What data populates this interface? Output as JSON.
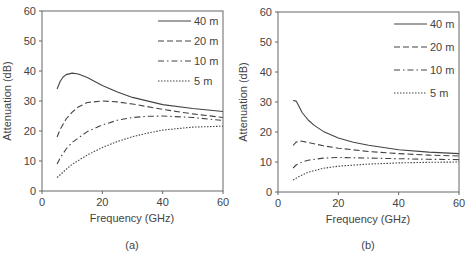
{
  "chart_data": [
    {
      "type": "line",
      "panel": "a",
      "caption": "(a)",
      "title": "",
      "xlabel": "Frequency (GHz)",
      "ylabel": "Attenuation (dB)",
      "xlim": [
        0,
        60
      ],
      "ylim": [
        0,
        60
      ],
      "xticks": [
        0,
        20,
        40,
        60
      ],
      "yticks": [
        0,
        10,
        20,
        30,
        40,
        50,
        60
      ],
      "grid": false,
      "legend_position": "upper right",
      "series": [
        {
          "name": "40 m",
          "style": "solid",
          "x": [
            5,
            6,
            7,
            8,
            10,
            12,
            15,
            20,
            25,
            30,
            40,
            50,
            60
          ],
          "y": [
            34,
            36.5,
            38,
            38.8,
            39.3,
            39,
            37.8,
            35.2,
            33,
            31.2,
            28.8,
            27.5,
            26.5
          ]
        },
        {
          "name": "20 m",
          "style": "dashed",
          "x": [
            5,
            6,
            8,
            10,
            12,
            15,
            20,
            25,
            30,
            40,
            50,
            60
          ],
          "y": [
            18,
            20.5,
            24,
            26.3,
            28,
            29.5,
            30,
            29.7,
            29,
            27.2,
            25.7,
            24.5
          ]
        },
        {
          "name": "10 m",
          "style": "dashdot",
          "x": [
            5,
            6,
            8,
            10,
            15,
            20,
            25,
            30,
            35,
            40,
            50,
            60
          ],
          "y": [
            9,
            11,
            14,
            16.2,
            19.8,
            22,
            23.6,
            24.5,
            24.9,
            25,
            24.5,
            23.5
          ]
        },
        {
          "name": "5 m",
          "style": "dotted",
          "x": [
            5,
            8,
            10,
            15,
            20,
            25,
            30,
            35,
            40,
            50,
            60
          ],
          "y": [
            4.5,
            7.2,
            8.9,
            12,
            14.5,
            16.5,
            18.1,
            19.3,
            20.3,
            21.3,
            21.6
          ]
        }
      ]
    },
    {
      "type": "line",
      "panel": "b",
      "caption": "(b)",
      "title": "",
      "xlabel": "Frequency (GHz)",
      "ylabel": "Attenuation (dB)",
      "xlim": [
        0,
        60
      ],
      "ylim": [
        0,
        60
      ],
      "xticks": [
        0,
        20,
        40,
        60
      ],
      "yticks": [
        0,
        10,
        20,
        30,
        40,
        50,
        60
      ],
      "grid": false,
      "legend_position": "upper right",
      "series": [
        {
          "name": "40 m",
          "style": "solid",
          "x": [
            5,
            6,
            7,
            8,
            10,
            12,
            15,
            20,
            25,
            30,
            40,
            50,
            60
          ],
          "y": [
            30.5,
            30.3,
            28.5,
            26.5,
            24,
            22.2,
            20.2,
            18,
            16.6,
            15.6,
            14.1,
            13.3,
            12.8
          ]
        },
        {
          "name": "20 m",
          "style": "dashed",
          "x": [
            5,
            6,
            7,
            8,
            10,
            15,
            20,
            30,
            40,
            50,
            60
          ],
          "y": [
            15.5,
            16.6,
            17,
            16.9,
            16.5,
            15.4,
            14.6,
            13.5,
            12.8,
            12.3,
            12
          ]
        },
        {
          "name": "10 m",
          "style": "dashdot",
          "x": [
            5,
            6,
            8,
            10,
            15,
            20,
            30,
            40,
            50,
            60
          ],
          "y": [
            8,
            9,
            10,
            10.6,
            11.3,
            11.5,
            11.3,
            11.1,
            10.9,
            10.8
          ]
        },
        {
          "name": "5 m",
          "style": "dotted",
          "x": [
            5,
            7,
            10,
            15,
            20,
            30,
            40,
            50,
            60
          ],
          "y": [
            4,
            5.2,
            6.6,
            7.9,
            8.6,
            9.3,
            9.7,
            9.9,
            10
          ]
        }
      ]
    }
  ],
  "panels": {
    "a": {
      "caption": "(a)",
      "xlabel": "Frequency (GHz)",
      "ylabel": "Attenuation (dB)",
      "xtick_labels": [
        "0",
        "20",
        "40",
        "60"
      ],
      "ytick_labels": [
        "0",
        "10",
        "20",
        "30",
        "40",
        "50",
        "60"
      ],
      "legend": [
        "40 m",
        "20 m",
        "10 m",
        "5 m"
      ]
    },
    "b": {
      "caption": "(b)",
      "xlabel": "Frequency (GHz)",
      "ylabel": "Attenuation (dB)",
      "xtick_labels": [
        "0",
        "20",
        "40",
        "60"
      ],
      "ytick_labels": [
        "0",
        "10",
        "20",
        "30",
        "40",
        "50",
        "60"
      ],
      "legend": [
        "40 m",
        "20 m",
        "10 m",
        "5 m"
      ]
    }
  },
  "colors": {
    "line": "#444444",
    "axis": "#555555",
    "text": "#444444"
  }
}
